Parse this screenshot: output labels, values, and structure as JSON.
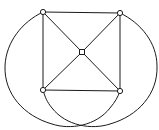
{
  "diagram": {
    "type": "graph",
    "colors": {
      "stroke": "#1a1a1a",
      "node_fill": "#ffffff",
      "background": "#ffffff"
    },
    "nodes": [
      {
        "id": "top-left",
        "x": 43,
        "y": 12,
        "shape": "circle"
      },
      {
        "id": "top-right",
        "x": 120,
        "y": 13,
        "shape": "circle"
      },
      {
        "id": "center",
        "x": 82,
        "y": 52,
        "shape": "square"
      },
      {
        "id": "bottom-left",
        "x": 43,
        "y": 90,
        "shape": "circle"
      },
      {
        "id": "bottom-right",
        "x": 120,
        "y": 91,
        "shape": "circle"
      }
    ],
    "edges": [
      {
        "from": "top-left",
        "to": "top-right",
        "kind": "straight"
      },
      {
        "from": "top-left",
        "to": "bottom-left",
        "kind": "straight"
      },
      {
        "from": "top-right",
        "to": "bottom-right",
        "kind": "straight"
      },
      {
        "from": "bottom-left",
        "to": "bottom-right",
        "kind": "straight"
      },
      {
        "from": "top-left",
        "to": "center",
        "kind": "straight"
      },
      {
        "from": "top-right",
        "to": "center",
        "kind": "straight"
      },
      {
        "from": "bottom-left",
        "to": "center",
        "kind": "straight"
      },
      {
        "from": "bottom-right",
        "to": "center",
        "kind": "straight"
      },
      {
        "from": "top-left",
        "to": "bottom-right",
        "kind": "arc-left"
      },
      {
        "from": "top-right",
        "to": "bottom-left",
        "kind": "arc-right"
      }
    ]
  }
}
